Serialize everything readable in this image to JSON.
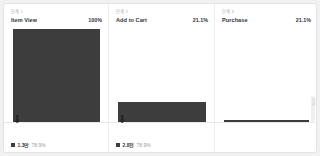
{
  "card": {
    "background_color": "#ffffff",
    "border_color": "#e3e3e3",
    "page_background": "#f1f1f1"
  },
  "colors": {
    "bar": "#3d3d3d",
    "step_name": "#31353b",
    "step_index": "#a8a8a8",
    "muted_text": "#9a9a9a",
    "divider": "#ececec"
  },
  "edge": {
    "vertical_label": "전환",
    "scrollbar_name": "vertical-scrollbar"
  },
  "chart_data": {
    "type": "bar",
    "title": "",
    "xlabel": "",
    "ylabel": "",
    "grid": false,
    "legend_position": "bottom-left-per-panel",
    "ylim": [
      0,
      100
    ],
    "categories": [
      "Item View",
      "Add to Cart",
      "Purchase"
    ],
    "values": [
      100,
      21.1,
      2.0
    ],
    "value_labels": [
      "100%",
      "21.1%",
      "21.1%"
    ],
    "series": [
      {
        "name": "users",
        "values": [
          100,
          21.1,
          2.0
        ]
      }
    ],
    "steps": [
      {
        "index_label": "단계 1",
        "name": "Item View",
        "rate": "100%",
        "bar_height_pct": 100,
        "dropoff_arrow": "⬇",
        "legend_value": "1.3만",
        "legend_pct": "78.9%",
        "has_footer_stats": true
      },
      {
        "index_label": "단계 2",
        "name": "Add to Cart",
        "rate": "21.1%",
        "bar_height_pct": 21.1,
        "dropoff_arrow": "⬇",
        "legend_value": "2.8천",
        "legend_pct": "78.9%",
        "has_footer_stats": true
      },
      {
        "index_label": "단계 3",
        "name": "Purchase",
        "rate": "21.1%",
        "bar_height_pct": 2.0,
        "dropoff_arrow": "",
        "legend_value": "",
        "legend_pct": "",
        "has_footer_stats": false
      }
    ]
  }
}
